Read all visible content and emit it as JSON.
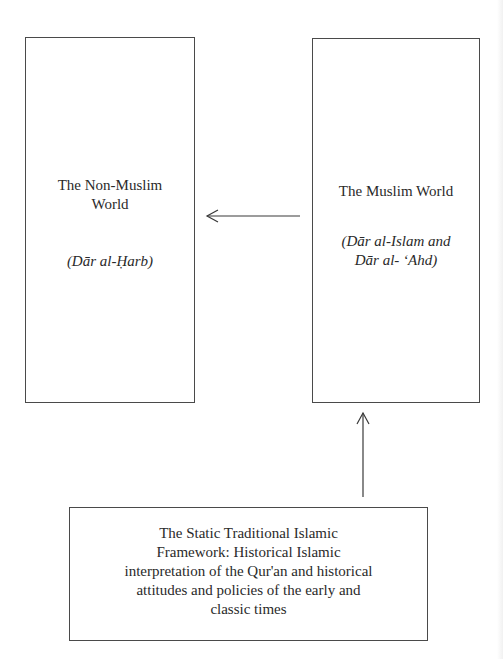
{
  "diagram": {
    "type": "flow",
    "nodes": [
      {
        "id": "non_muslim_world",
        "title_lines": [
          "The Non-Muslim",
          "World"
        ],
        "subtitle_lines": [
          "(Dār al-Ḥarb)"
        ]
      },
      {
        "id": "muslim_world",
        "title_lines": [
          "The Muslim World"
        ],
        "subtitle_lines": [
          "(Dār al-Islam and",
          "Dār al- ʻAhd)"
        ]
      },
      {
        "id": "static_traditional_framework",
        "text_lines": [
          "The Static Traditional Islamic",
          "Framework: Historical Islamic",
          "interpretation of the Qur'an and historical",
          "attitudes and policies of the early and",
          "classic times"
        ]
      }
    ],
    "edges": [
      {
        "from": "muslim_world",
        "to": "non_muslim_world",
        "direction": "left"
      },
      {
        "from": "static_traditional_framework",
        "to": "muslim_world",
        "direction": "up"
      }
    ],
    "colors": {
      "line": "#3a3a3a",
      "text": "#2a2a2a",
      "background": "#ffffff"
    }
  }
}
